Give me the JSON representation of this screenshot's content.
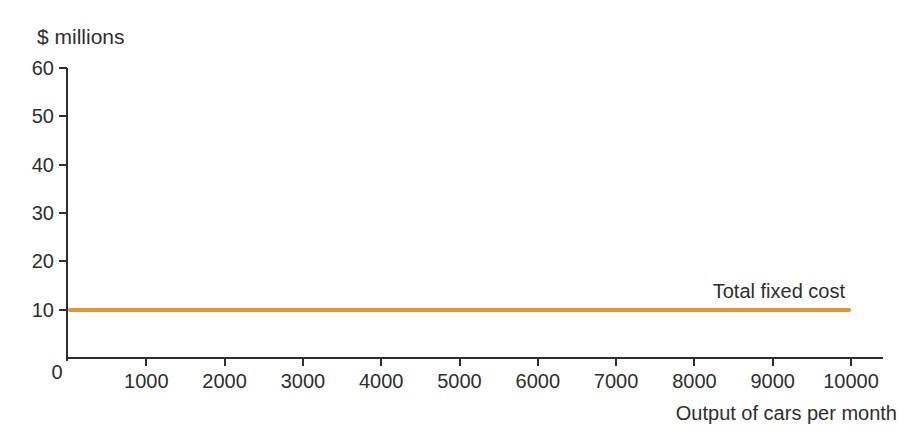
{
  "chart_data": {
    "type": "line",
    "title": "",
    "ylabel": "$ millions",
    "xlabel": "Output of cars per month",
    "x_ticks": [
      1000,
      2000,
      3000,
      4000,
      5000,
      6000,
      7000,
      8000,
      9000,
      10000
    ],
    "y_ticks": [
      0,
      10,
      20,
      30,
      40,
      50,
      60
    ],
    "origin_label": "0",
    "xlim": [
      0,
      10400
    ],
    "ylim": [
      0,
      60
    ],
    "grid": false,
    "legend_position": "none",
    "series": [
      {
        "name": "Total fixed cost",
        "x": [
          0,
          10000
        ],
        "y": [
          10,
          10
        ],
        "color": "#e8923a",
        "label_placement": "above line, right end"
      }
    ]
  },
  "colors": {
    "axis": "#2e2e2e",
    "text": "#2e2e2e",
    "line": "#e8923a",
    "background": "#ffffff"
  }
}
